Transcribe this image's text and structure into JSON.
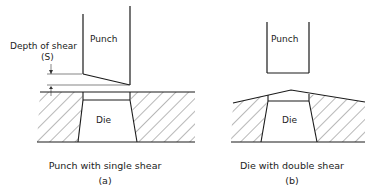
{
  "figure_a": {
    "punch_label": "Punch",
    "die_label": "Die",
    "depth_label": "Depth of shear",
    "depth_symbol": "(S)",
    "caption": "Punch with single shear",
    "sublabel": "(a)"
  },
  "figure_b": {
    "punch_label": "Punch",
    "die_label": "Die",
    "caption": "Die with double shear",
    "sublabel": "(b)"
  },
  "colors": {
    "line": "#1a1a1a",
    "background": "#ffffff"
  }
}
